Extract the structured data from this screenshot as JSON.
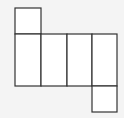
{
  "diagram": {
    "type": "cuboid-net",
    "background": "#f4f4f4",
    "stroke": "#333333",
    "fill": "#ffffff",
    "faces": [
      {
        "name": "top-face",
        "x": 15,
        "y": 8,
        "w": 26,
        "h": 26
      },
      {
        "name": "front-face",
        "x": 15,
        "y": 34,
        "w": 26,
        "h": 52
      },
      {
        "name": "side-face-1",
        "x": 41,
        "y": 34,
        "w": 26,
        "h": 52
      },
      {
        "name": "back-face",
        "x": 67,
        "y": 34,
        "w": 25,
        "h": 52
      },
      {
        "name": "side-face-2",
        "x": 92,
        "y": 34,
        "w": 25,
        "h": 52
      },
      {
        "name": "bottom-face",
        "x": 92,
        "y": 86,
        "w": 25,
        "h": 26
      }
    ]
  }
}
